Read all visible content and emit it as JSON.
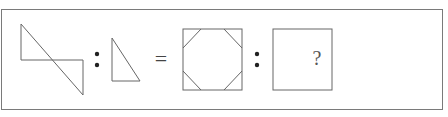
{
  "puzzle": {
    "type": "analogy",
    "operators": {
      "ratio": ":",
      "equals": "="
    },
    "unknown_label": "?",
    "figures": [
      {
        "id": "figure-1",
        "description": "two right triangles joined by a long diagonal, forming a Z-shaped outline"
      },
      {
        "id": "figure-2",
        "description": "single right triangle"
      },
      {
        "id": "figure-3",
        "description": "square with four corner triangles cut by diagonals (octagon inside square)"
      },
      {
        "id": "figure-4",
        "description": "empty square containing question mark"
      }
    ]
  },
  "colors": {
    "line": "#666666",
    "frame": "#7a7a7a",
    "background": "#ffffff"
  }
}
